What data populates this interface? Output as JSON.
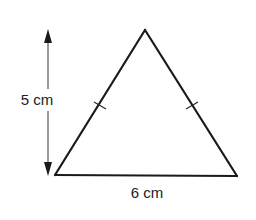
{
  "figure": {
    "type": "isosceles-triangle",
    "labels": {
      "height": "5 cm",
      "base": "6 cm"
    },
    "measurements": {
      "height_cm": 5,
      "base_cm": 6
    },
    "equal_sides_marked": [
      "left",
      "right"
    ],
    "colors": {
      "stroke": "#1a1a1a",
      "text": "#222222",
      "background": "#ffffff"
    }
  }
}
